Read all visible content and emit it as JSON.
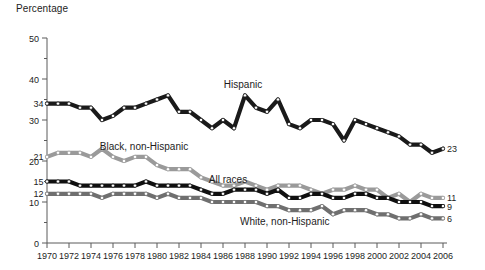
{
  "chart_data": {
    "type": "line",
    "title": "",
    "ylabel": "Percentage",
    "xlabel": "",
    "ylim": [
      0,
      50
    ],
    "xlim": [
      1970,
      2006
    ],
    "grid": false,
    "legend_position": "inline-annotations",
    "ytick_labels": [
      "0",
      "10",
      "20",
      "30",
      "40",
      "50"
    ],
    "ytick_values": [
      0,
      10,
      20,
      30,
      40,
      50
    ],
    "yminor_values": [
      5,
      15,
      25,
      35,
      45
    ],
    "xtick_labels": [
      "1970",
      "1972",
      "1974",
      "1976",
      "1978",
      "1980",
      "1982",
      "1984",
      "1986",
      "1988",
      "1990",
      "1992",
      "1994",
      "1996",
      "1998",
      "2000",
      "2002",
      "2004",
      "2006"
    ],
    "xtick_values": [
      1970,
      1972,
      1974,
      1976,
      1978,
      1980,
      1982,
      1984,
      1986,
      1988,
      1990,
      1992,
      1994,
      1996,
      1998,
      2000,
      2002,
      2004,
      2006
    ],
    "x": [
      1970,
      1971,
      1972,
      1973,
      1974,
      1975,
      1976,
      1977,
      1978,
      1979,
      1980,
      1981,
      1982,
      1983,
      1984,
      1985,
      1986,
      1987,
      1988,
      1989,
      1990,
      1991,
      1992,
      1993,
      1994,
      1995,
      1996,
      1997,
      1998,
      1999,
      2000,
      2001,
      2002,
      2003,
      2004,
      2005,
      2006
    ],
    "series": [
      {
        "name": "Hispanic",
        "color": "#1a1a1a",
        "start_label": "34",
        "end_label": "23",
        "label_x": 1988,
        "values": [
          34,
          34,
          34,
          33,
          33,
          30,
          31,
          33,
          33,
          34,
          35,
          36,
          32,
          32,
          30,
          28,
          30,
          28,
          36,
          33,
          32,
          35,
          29,
          28,
          30,
          30,
          29,
          25,
          30,
          29,
          28,
          27,
          26,
          24,
          24,
          22,
          23
        ]
      },
      {
        "name": "Black, non-Hispanic",
        "color": "#9a9a9a",
        "start_label": "21",
        "end_label": "11",
        "label_x": 1979,
        "values": [
          21,
          22,
          22,
          22,
          21,
          23,
          21,
          20,
          21,
          21,
          19,
          18,
          18,
          18,
          16,
          15,
          14,
          14,
          15,
          14,
          13,
          14,
          14,
          14,
          13,
          12,
          13,
          13,
          14,
          13,
          13,
          11,
          12,
          10,
          12,
          11,
          11
        ]
      },
      {
        "name": "All races",
        "color": "#101010",
        "start_label": "15",
        "end_label": "9",
        "label_x": 1987,
        "values": [
          15,
          15,
          15,
          14,
          14,
          14,
          14,
          14,
          14,
          15,
          14,
          14,
          14,
          14,
          13,
          12,
          12,
          13,
          13,
          13,
          12,
          13,
          11,
          11,
          12,
          12,
          11,
          11,
          12,
          12,
          11,
          11,
          10,
          10,
          10,
          9,
          9
        ]
      },
      {
        "name": "White, non-Hispanic",
        "color": "#6f6f6f",
        "start_label": "12",
        "end_label": "6",
        "label_x": 1991,
        "values": [
          12,
          12,
          12,
          12,
          12,
          11,
          12,
          12,
          12,
          12,
          11,
          12,
          11,
          11,
          11,
          10,
          10,
          10,
          10,
          10,
          9,
          9,
          8,
          8,
          8,
          9,
          7,
          8,
          8,
          8,
          7,
          7,
          6,
          6,
          7,
          6,
          6
        ]
      }
    ]
  }
}
